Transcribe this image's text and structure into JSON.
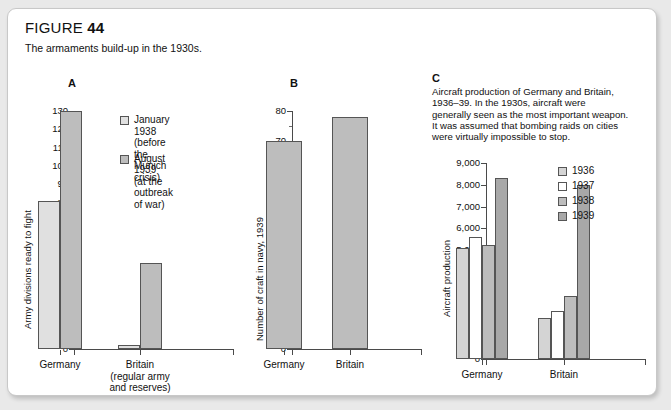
{
  "figure": {
    "label": "FIGURE",
    "number": "44",
    "caption": "The armaments build-up in the 1930s."
  },
  "colors": {
    "page_background": "#e9e9e9",
    "card_background": "#ffffff",
    "card_border": "#c8c8c8",
    "axis": "#4a4a4a",
    "bar_light": "#e0e0e0",
    "bar_mid": "#bdbdbd",
    "bar_white": "#ffffff",
    "bar_dark": "#aaaaaa",
    "bar_outline": "#555555",
    "text": "#111111"
  },
  "panels": [
    {
      "letter": "A",
      "ylabel": "Army divisions ready to fight",
      "legend": [
        {
          "label": "January 1938\n(before the\nMunich crisis)",
          "color": "#e0e0e0"
        },
        {
          "label": "August 1939\n(at the outbreak\nof war)",
          "color": "#bdbdbd"
        }
      ]
    },
    {
      "letter": "B",
      "ylabel": "Number of craft in navy, 1939",
      "legend": []
    },
    {
      "letter": "C",
      "ylabel": "Aircraft production",
      "caption": "Aircraft production of Germany and Britain,\n1936–39. In the 1930s, aircraft were\ngenerally seen as the most important weapon.\nIt was assumed that bombing raids on cities\nwere virtually impossible to stop.",
      "legend": [
        {
          "label": "1936",
          "color": "#d4d4d4"
        },
        {
          "label": "1937",
          "color": "#ffffff"
        },
        {
          "label": "1938",
          "color": "#bdbdbd"
        },
        {
          "label": "1939",
          "color": "#a8a8a8"
        }
      ]
    }
  ],
  "chart_data": [
    {
      "type": "bar",
      "panel": "A",
      "title": "Army divisions ready to fight",
      "xlabel": "",
      "ylabel": "Army divisions ready to fight",
      "categories": [
        "Germany",
        "Britain\n(regular army\nand reserves)"
      ],
      "series": [
        {
          "name": "January 1938 (before the Munich crisis)",
          "values": [
            81,
            2
          ],
          "color": "#e0e0e0"
        },
        {
          "name": "August 1939 (at the outbreak of war)",
          "values": [
            130,
            47
          ],
          "color": "#bdbdbd"
        }
      ],
      "ylim": [
        0,
        130
      ],
      "ytick_step": 10,
      "yticks": [
        0,
        10,
        20,
        30,
        40,
        50,
        60,
        70,
        80,
        90,
        100,
        110,
        120,
        130
      ],
      "grid": false,
      "legend_position": "top-right"
    },
    {
      "type": "bar",
      "panel": "B",
      "title": "Number of craft in navy, 1939",
      "xlabel": "",
      "ylabel": "Number of craft in navy, 1939",
      "categories": [
        "Germany",
        "Britain"
      ],
      "series": [
        {
          "name": "Craft in navy, 1939",
          "values": [
            70,
            78
          ],
          "color": "#bdbdbd"
        }
      ],
      "ylim": [
        0,
        80
      ],
      "ytick_step": 10,
      "yticks": [
        0,
        10,
        20,
        30,
        40,
        50,
        60,
        70,
        80
      ],
      "grid": false,
      "legend_position": "none"
    },
    {
      "type": "bar",
      "panel": "C",
      "title": "Aircraft production",
      "xlabel": "",
      "ylabel": "Aircraft production",
      "categories": [
        "Germany",
        "Britain"
      ],
      "series": [
        {
          "name": "1936",
          "values": [
            5100,
            1900
          ],
          "color": "#d4d4d4"
        },
        {
          "name": "1937",
          "values": [
            5600,
            2200
          ],
          "color": "#ffffff"
        },
        {
          "name": "1938",
          "values": [
            5250,
            2900
          ],
          "color": "#bdbdbd"
        },
        {
          "name": "1939",
          "values": [
            8300,
            8000
          ],
          "color": "#a8a8a8"
        }
      ],
      "ylim": [
        0,
        9000
      ],
      "ytick_step": 1000,
      "yticks": [
        "0",
        "1,000",
        "2,000",
        "3,000",
        "4,000",
        "5,000",
        "6,000",
        "7,000",
        "8,000",
        "9,000"
      ],
      "grid": false,
      "legend_position": "top-right"
    }
  ]
}
